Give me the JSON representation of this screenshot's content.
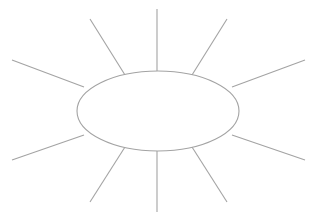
{
  "document": {
    "title": "Sun Diagram Graphic Organizer",
    "background_color": "#ffffff",
    "line_color": "#a3a3a3",
    "fill_color": "#ffffff",
    "width": 316,
    "height": 221
  },
  "chart_data": {
    "type": "diagram",
    "diagram_kind": "sun-diagram",
    "title": "",
    "subtitle": "",
    "center_shape": {
      "name": "center-ellipse",
      "shape": "ellipse",
      "cx": 158,
      "cy": 111,
      "rx": 81,
      "ry": 40,
      "label": "",
      "stroke": "#a3a3a3",
      "fill": "#ffffff"
    },
    "ray_count": 10,
    "rays": [
      {
        "name": "ray-top",
        "label": "",
        "angle_deg": -90,
        "x1": 157,
        "y1": 71,
        "x2": 157,
        "y2": 9
      },
      {
        "name": "ray-upper-right",
        "label": "",
        "angle_deg": -56,
        "x1": 192,
        "y1": 75,
        "x2": 227,
        "y2": 19
      },
      {
        "name": "ray-right-upper",
        "label": "",
        "angle_deg": -23,
        "x1": 232,
        "y1": 87,
        "x2": 305,
        "y2": 60
      },
      {
        "name": "ray-right-lower",
        "label": "",
        "angle_deg": 23,
        "x1": 232,
        "y1": 135,
        "x2": 305,
        "y2": 160
      },
      {
        "name": "ray-lower-right",
        "label": "",
        "angle_deg": 56,
        "x1": 192,
        "y1": 147,
        "x2": 227,
        "y2": 202
      },
      {
        "name": "ray-bottom",
        "label": "",
        "angle_deg": 90,
        "x1": 157,
        "y1": 151,
        "x2": 157,
        "y2": 212
      },
      {
        "name": "ray-lower-left",
        "label": "",
        "angle_deg": 124,
        "x1": 125,
        "y1": 147,
        "x2": 90,
        "y2": 202
      },
      {
        "name": "ray-left-lower",
        "label": "",
        "angle_deg": 157,
        "x1": 84,
        "y1": 135,
        "x2": 12,
        "y2": 160
      },
      {
        "name": "ray-left-upper",
        "label": "",
        "angle_deg": 203,
        "x1": 84,
        "y1": 87,
        "x2": 12,
        "y2": 60
      },
      {
        "name": "ray-upper-left",
        "label": "",
        "angle_deg": 236,
        "x1": 125,
        "y1": 75,
        "x2": 90,
        "y2": 19
      }
    ],
    "legend": [],
    "annotations": []
  }
}
